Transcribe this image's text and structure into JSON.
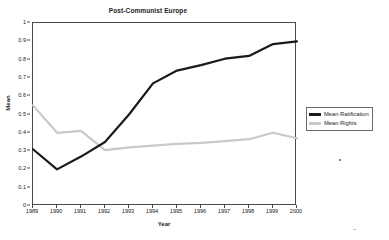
{
  "chart_data": {
    "type": "line",
    "title": "Post-Communist Europe",
    "xlabel": "Year",
    "ylabel": "Mean",
    "x": [
      1989,
      1990,
      1991,
      1992,
      1993,
      1994,
      1995,
      1996,
      1997,
      1998,
      1999,
      2000
    ],
    "xticklabels": [
      "1989",
      "1990",
      "1991",
      "1992",
      "1993",
      "1994",
      "1995",
      "1996",
      "1997",
      "1998",
      "1999",
      "2000"
    ],
    "yticklabels": [
      "0",
      "0.1",
      "0.2",
      "0.3",
      "0.4",
      "0.5",
      "0.6",
      "0.7",
      "0.8",
      "0.9",
      "1"
    ],
    "yticks": [
      0,
      0.1,
      0.2,
      0.3,
      0.4,
      0.5,
      0.6,
      0.7,
      0.8,
      0.9,
      1
    ],
    "ylim": [
      0,
      1
    ],
    "xlim": [
      1989,
      2000
    ],
    "grid": false,
    "legend_position": "right-outside",
    "series": [
      {
        "name": "Mean Ratification",
        "color": "#1a1a1a",
        "width": 2.2,
        "values": [
          0.31,
          0.2,
          0.27,
          0.35,
          0.5,
          0.67,
          0.74,
          0.77,
          0.805,
          0.82,
          0.885,
          0.9
        ]
      },
      {
        "name": "Mean Rights",
        "color": "#c9c9c9",
        "width": 2.2,
        "values": [
          0.55,
          0.4,
          0.41,
          0.305,
          0.32,
          0.33,
          0.34,
          0.345,
          0.355,
          0.365,
          0.4,
          0.37
        ]
      }
    ]
  }
}
